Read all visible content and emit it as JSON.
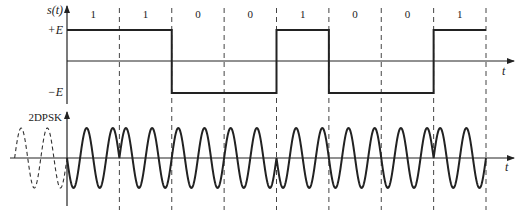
{
  "figure": {
    "top_panel": {
      "ylabel": "s(t)",
      "plus_level_label": "+E",
      "minus_level_label": "−E",
      "xlabel": "t",
      "bits": [
        "1",
        "1",
        "0",
        "0",
        "1",
        "0",
        "0",
        "1"
      ],
      "levels": [
        1,
        1,
        -1,
        -1,
        1,
        -1,
        -1,
        1
      ]
    },
    "bottom_panel": {
      "ylabel": "2DPSK",
      "xlabel": "t",
      "reference_cycles": 2,
      "cycles_per_bit": 2,
      "phases": [
        -1,
        1,
        1,
        1,
        -1,
        -1,
        -1,
        1
      ]
    },
    "colors": {
      "line": "#222222",
      "background": "#ffffff"
    }
  }
}
